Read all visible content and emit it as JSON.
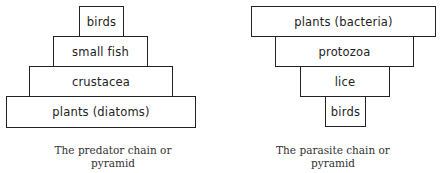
{
  "diagrams": [
    {
      "name": "predator-pyramid",
      "levels": [
        {
          "label": "birds",
          "x": 79,
          "y": 6,
          "w": 45,
          "h": 31
        },
        {
          "label": "small fish",
          "x": 53,
          "y": 36,
          "w": 95,
          "h": 31
        },
        {
          "label": "crustacea",
          "x": 29,
          "y": 66,
          "w": 144,
          "h": 31
        },
        {
          "label": "plants (diatoms)",
          "x": 6,
          "y": 96,
          "w": 190,
          "h": 32
        }
      ],
      "caption_line1": "The predator chain or",
      "caption_line2": "pyramid"
    },
    {
      "name": "parasite-pyramid",
      "levels": [
        {
          "label": "plants (bacteria)",
          "x": 251,
          "y": 6,
          "w": 185,
          "h": 31
        },
        {
          "label": "protozoa",
          "x": 275,
          "y": 36,
          "w": 139,
          "h": 31
        },
        {
          "label": "lice",
          "x": 300,
          "y": 66,
          "w": 90,
          "h": 31
        },
        {
          "label": "birds",
          "x": 325,
          "y": 96,
          "w": 41,
          "h": 31
        }
      ],
      "caption_line1": "The parasite chain or",
      "caption_line2": "pyramid"
    }
  ]
}
